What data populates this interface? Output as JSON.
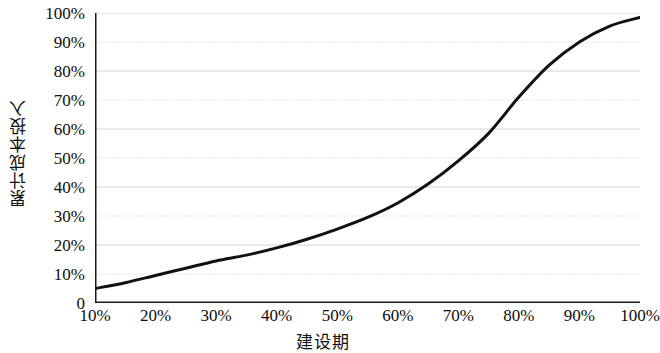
{
  "chart_data": {
    "type": "line",
    "title": "",
    "subtitle": "",
    "xlabel": "建设期",
    "ylabel": "累计成本投入",
    "xlim": [
      10,
      100
    ],
    "ylim": [
      0,
      100
    ],
    "grid": "horizontal",
    "legend": "none",
    "x_unit": "%",
    "y_unit": "%",
    "x_tick_labels": [
      "10%",
      "20%",
      "30%",
      "40%",
      "50%",
      "60%",
      "70%",
      "80%",
      "90%",
      "100%"
    ],
    "y_tick_labels": [
      "0",
      "10%",
      "20%",
      "30%",
      "40%",
      "50%",
      "60%",
      "70%",
      "80%",
      "90%",
      "100%"
    ],
    "x_ticks": [
      10,
      20,
      30,
      40,
      50,
      60,
      70,
      80,
      90,
      100
    ],
    "y_ticks": [
      0,
      10,
      20,
      30,
      40,
      50,
      60,
      70,
      80,
      90,
      100
    ],
    "x": [
      10,
      15,
      20,
      25,
      30,
      35,
      40,
      45,
      50,
      55,
      60,
      65,
      70,
      75,
      80,
      85,
      90,
      95,
      100
    ],
    "series": [
      {
        "name": "累计成本投入",
        "color": "#111111",
        "line_width": 3,
        "values": [
          5,
          7,
          9.5,
          12,
          14.5,
          16.5,
          19,
          22,
          25.5,
          29.5,
          34.5,
          41,
          49,
          58.5,
          71,
          82,
          90,
          95.5,
          98.5
        ]
      }
    ]
  },
  "axis": {
    "y_title": "累计成本投入",
    "x_title": "建设期"
  },
  "style": {
    "axis_color": "#1a1a1a",
    "grid_color": "#d4d4d4",
    "curve_color": "#111111",
    "background": "#ffffff"
  }
}
